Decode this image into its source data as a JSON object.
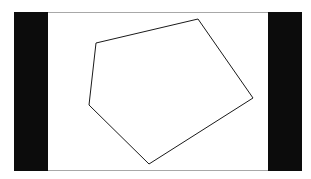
{
  "figure": {
    "type": "polygon",
    "shape": "pentagon",
    "stroke_color": "#1a1a1a",
    "fill_color": "none",
    "stroke_width": 1,
    "vertices": [
      {
        "x": 96,
        "y": 43
      },
      {
        "x": 198,
        "y": 19
      },
      {
        "x": 253,
        "y": 98
      },
      {
        "x": 149,
        "y": 164
      },
      {
        "x": 89,
        "y": 105
      }
    ]
  },
  "frame": {
    "background": "#ffffff",
    "border_color": "#a8a8a8",
    "letterbox_color": "#0c0c0c"
  }
}
